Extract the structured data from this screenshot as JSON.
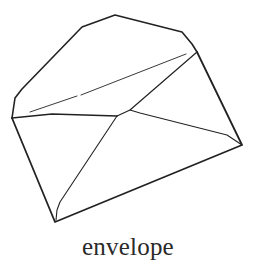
{
  "illustration": {
    "subject": "envelope-icon",
    "caption": "envelope",
    "stroke_color": "#222222",
    "background_color": "#ffffff"
  }
}
